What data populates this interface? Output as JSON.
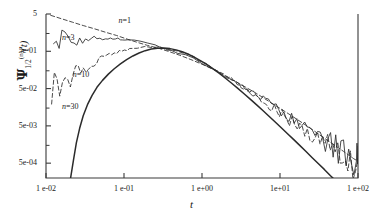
{
  "chart_data": {
    "type": "line",
    "title": "",
    "xlabel": "t",
    "ylabel_plain": "Psi_1/2^(n)(t)",
    "xscale": "log",
    "yscale": "log",
    "xlim": [
      0.01,
      100.0
    ],
    "ylim": [
      0.0002,
      5.0
    ],
    "grid": false,
    "legend_position": "inline-annotations",
    "xticks": [
      {
        "value": 0.01,
        "label": "1 e-02"
      },
      {
        "value": 0.1,
        "label": "1 e-01"
      },
      {
        "value": 1.0,
        "label": "1 e+00"
      },
      {
        "value": 10.0,
        "label": "1e+01"
      },
      {
        "value": 100.0,
        "label": "1  e+02"
      }
    ],
    "yticks": [
      {
        "value": 5.0,
        "label": "5"
      },
      {
        "value": 0.5,
        "label": "5e-01"
      },
      {
        "value": 0.05,
        "label": "5e-02"
      },
      {
        "value": 0.005,
        "label": "5e-03"
      },
      {
        "value": 0.0005,
        "label": "5e-04"
      }
    ],
    "annotations": [
      {
        "text": "n=1",
        "x": 0.085,
        "y": 3.2,
        "series": "n=1"
      },
      {
        "text": "n=3",
        "x": 0.016,
        "y": 1.15,
        "series": "n=3"
      },
      {
        "text": "n=10",
        "x": 0.022,
        "y": 0.115,
        "series": "n=10"
      },
      {
        "text": "n=30",
        "x": 0.016,
        "y": 0.016,
        "series": "n=30"
      }
    ],
    "series": [
      {
        "name": "n=1",
        "style": "dashed",
        "color": "#2b2b2b",
        "description": "Upper dashed envelope: decreasing from 5 at t=1e-02 through the common crossing near t=1.2e-01, then power-law decay.",
        "points": [
          [
            0.0115,
            4.6
          ],
          [
            0.016,
            3.7
          ],
          [
            0.022,
            3.0
          ],
          [
            0.03,
            2.45
          ],
          [
            0.042,
            2.0
          ],
          [
            0.058,
            1.62
          ],
          [
            0.08,
            1.33
          ],
          [
            0.11,
            1.06
          ],
          [
            0.15,
            0.86
          ],
          [
            0.2,
            0.72
          ],
          [
            0.28,
            0.6
          ],
          [
            0.38,
            0.49
          ],
          [
            0.52,
            0.39
          ],
          [
            0.72,
            0.3
          ],
          [
            1.0,
            0.225
          ],
          [
            1.4,
            0.163
          ],
          [
            1.9,
            0.115
          ],
          [
            2.6,
            0.08
          ],
          [
            3.6,
            0.055
          ],
          [
            5.0,
            0.037
          ],
          [
            6.8,
            0.0245
          ],
          [
            9.4,
            0.016
          ],
          [
            13.0,
            0.0104
          ],
          [
            18.0,
            0.00665
          ],
          [
            25.0,
            0.0042
          ],
          [
            34.0,
            0.00265
          ],
          [
            47.0,
            0.00166
          ],
          [
            65.0,
            0.00104
          ],
          [
            88.0,
            0.00066
          ],
          [
            100.0,
            0.00056
          ]
        ]
      },
      {
        "name": "n=3",
        "style": "solid-noisy",
        "color": "#2b2b2b",
        "description": "Nearly flat plateau near 1.1 at small t with small ripples, joins the crossing at t~1.2e-01, then follows the common power-law decay with noise growing at large t.",
        "points": [
          [
            0.0125,
            1.12
          ],
          [
            0.016,
            1.16
          ],
          [
            0.021,
            1.13
          ],
          [
            0.027,
            1.17
          ],
          [
            0.035,
            1.12
          ],
          [
            0.045,
            1.16
          ],
          [
            0.058,
            1.1
          ],
          [
            0.072,
            1.13
          ],
          [
            0.09,
            1.08
          ],
          [
            0.11,
            1.03
          ],
          [
            0.135,
            0.95
          ],
          [
            0.165,
            0.88
          ],
          [
            0.2,
            0.8
          ],
          [
            0.25,
            0.72
          ],
          [
            0.31,
            0.64
          ],
          [
            0.39,
            0.55
          ],
          [
            0.49,
            0.465
          ],
          [
            0.61,
            0.385
          ],
          [
            0.77,
            0.312
          ],
          [
            0.97,
            0.248
          ],
          [
            1.22,
            0.193
          ],
          [
            1.54,
            0.148
          ],
          [
            1.93,
            0.112
          ],
          [
            2.43,
            0.0845
          ],
          [
            3.06,
            0.063
          ],
          [
            3.85,
            0.0465
          ],
          [
            4.84,
            0.0345
          ],
          [
            6.09,
            0.0253
          ],
          [
            7.66,
            0.0186
          ],
          [
            9.64,
            0.0136
          ],
          [
            12.1,
            0.0099
          ],
          [
            15.2,
            0.00725
          ],
          [
            19.2,
            0.00525
          ],
          [
            24.1,
            0.00383
          ],
          [
            30.3,
            0.00278
          ],
          [
            38.2,
            0.00202
          ],
          [
            48.0,
            0.00147
          ],
          [
            60.4,
            0.00107
          ],
          [
            76.0,
            0.00078
          ],
          [
            95.6,
            0.00057
          ],
          [
            100.0,
            0.00054
          ]
        ]
      },
      {
        "name": "n=10",
        "style": "dashed-noisy",
        "color": "#2b2b2b",
        "description": "Rises steeply from ~0.045 at t=1e-02, bends over and merges into the crossing at t~1.5e-01, then follows the common decay with increasing scatter.",
        "points": [
          [
            0.0118,
            0.042
          ],
          [
            0.015,
            0.062
          ],
          [
            0.019,
            0.09
          ],
          [
            0.024,
            0.128
          ],
          [
            0.03,
            0.175
          ],
          [
            0.038,
            0.232
          ],
          [
            0.048,
            0.3
          ],
          [
            0.06,
            0.375
          ],
          [
            0.075,
            0.45
          ],
          [
            0.094,
            0.52
          ],
          [
            0.118,
            0.58
          ],
          [
            0.148,
            0.625
          ],
          [
            0.185,
            0.65
          ],
          [
            0.232,
            0.65
          ],
          [
            0.29,
            0.625
          ],
          [
            0.363,
            0.58
          ],
          [
            0.455,
            0.52
          ],
          [
            0.57,
            0.45
          ],
          [
            0.713,
            0.375
          ],
          [
            0.893,
            0.3
          ],
          [
            1.12,
            0.235
          ],
          [
            1.4,
            0.18
          ],
          [
            1.75,
            0.135
          ],
          [
            2.19,
            0.1
          ],
          [
            2.75,
            0.0735
          ],
          [
            3.44,
            0.0535
          ],
          [
            4.31,
            0.0388
          ],
          [
            5.39,
            0.028
          ],
          [
            6.75,
            0.0202
          ],
          [
            8.45,
            0.0145
          ],
          [
            10.6,
            0.0104
          ],
          [
            13.2,
            0.00745
          ],
          [
            16.6,
            0.00533
          ],
          [
            20.8,
            0.0038
          ],
          [
            26.0,
            0.00271
          ],
          [
            32.6,
            0.00193
          ],
          [
            40.8,
            0.00137
          ],
          [
            51.0,
            0.00097
          ],
          [
            63.9,
            0.00069
          ],
          [
            80.0,
            0.00049
          ],
          [
            100.0,
            0.00044
          ]
        ]
      },
      {
        "name": "n=30",
        "style": "solid",
        "color": "#2b2b2b",
        "description": "Sharp cutoff below t~2e-02, rises very steeply, reaches the common peak near t=1.3e-01 and then follows the common power-law decay as the heavy trend line.",
        "points": [
          [
            0.0205,
            0.00018
          ],
          [
            0.0225,
            0.0006
          ],
          [
            0.0245,
            0.00175
          ],
          [
            0.027,
            0.0043
          ],
          [
            0.03,
            0.0093
          ],
          [
            0.034,
            0.0185
          ],
          [
            0.039,
            0.033
          ],
          [
            0.045,
            0.054
          ],
          [
            0.053,
            0.083
          ],
          [
            0.063,
            0.122
          ],
          [
            0.075,
            0.17
          ],
          [
            0.09,
            0.23
          ],
          [
            0.108,
            0.3
          ],
          [
            0.13,
            0.375
          ],
          [
            0.156,
            0.45
          ],
          [
            0.187,
            0.52
          ],
          [
            0.224,
            0.575
          ],
          [
            0.269,
            0.605
          ],
          [
            0.323,
            0.61
          ],
          [
            0.388,
            0.59
          ],
          [
            0.465,
            0.545
          ],
          [
            0.558,
            0.485
          ],
          [
            0.67,
            0.415
          ],
          [
            0.804,
            0.345
          ],
          [
            0.965,
            0.278
          ],
          [
            1.16,
            0.218
          ],
          [
            1.39,
            0.168
          ],
          [
            1.67,
            0.127
          ],
          [
            2.0,
            0.0945
          ],
          [
            2.4,
            0.0695
          ],
          [
            2.88,
            0.0505
          ],
          [
            3.46,
            0.0364
          ],
          [
            4.15,
            0.026
          ],
          [
            4.98,
            0.0185
          ],
          [
            5.98,
            0.0131
          ],
          [
            7.17,
            0.0092
          ],
          [
            8.61,
            0.00645
          ],
          [
            10.3,
            0.0045
          ],
          [
            12.4,
            0.00313
          ],
          [
            14.9,
            0.00217
          ],
          [
            17.9,
            0.0015
          ],
          [
            21.4,
            0.00104
          ],
          [
            25.7,
            0.00071
          ],
          [
            30.9,
            0.00049
          ],
          [
            37.0,
            0.00034
          ],
          [
            44.4,
            0.00023
          ],
          [
            53.3,
            0.00016
          ],
          [
            64.0,
            0.00011
          ],
          [
            76.8,
            7.5e-05
          ],
          [
            92.2,
            5.1e-05
          ],
          [
            100.0,
            4.3e-05
          ]
        ]
      }
    ]
  },
  "axes": {
    "ylabel": {
      "symbol": "Ψ",
      "sub": "1/2",
      "sup": "(n)",
      "arg": "(t)"
    },
    "xlabel": "t"
  },
  "colors": {
    "axis": "#3a3a3a",
    "line": "#2b2b2b",
    "text": "#1a1a1a",
    "background": "#ffffff"
  }
}
